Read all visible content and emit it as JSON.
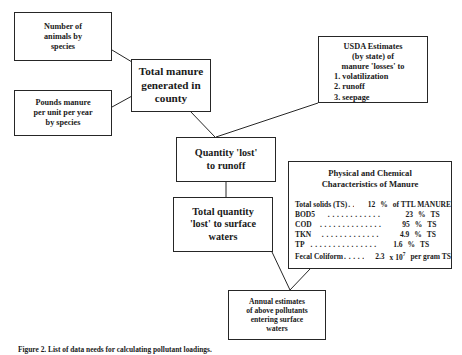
{
  "diagram": {
    "nodes": {
      "animals": {
        "name": "number-of-animals",
        "lines": [
          "Number of",
          "animals by",
          "species"
        ]
      },
      "pounds": {
        "name": "pounds-manure",
        "lines": [
          "Pounds manure",
          "per unit per year",
          "by species"
        ]
      },
      "total_manure": {
        "name": "total-manure-generated",
        "lines": [
          "Total manure",
          "generated in",
          "county"
        ]
      },
      "usda": {
        "name": "usda-estimates",
        "header": [
          "USDA Estimates",
          "(by state) of",
          "manure 'losses' to"
        ],
        "list": [
          "1.  volatilization",
          "2.  runoff",
          "3.  seepage"
        ]
      },
      "quantity_lost": {
        "name": "quantity-lost-runoff",
        "lines": [
          "Quantity 'lost'",
          "to runoff"
        ]
      },
      "total_quantity": {
        "name": "total-quantity-surface-waters",
        "lines": [
          "Total quantity",
          "'lost' to surface",
          "waters"
        ]
      },
      "chem": {
        "name": "manure-characteristics",
        "title": [
          "Physical and Chemical",
          "Characteristics of Manure"
        ],
        "rows": [
          {
            "label": "Total solids (TS)",
            "dots": ". . . .",
            "value": "12",
            "unit": "%",
            "rest": "of TTL MANURE",
            "exponent": ""
          },
          {
            "label": "BOD5",
            "dots": ". . . . . . . . . . . .",
            "value": "23",
            "unit": "%",
            "rest": "TS",
            "exponent": ""
          },
          {
            "label": "COD",
            "dots": ". . . . . . . . . . . . . .",
            "value": "95",
            "unit": "%",
            "rest": "TS",
            "exponent": ""
          },
          {
            "label": "TKN",
            "dots": ". . . . . . . . . . . . .",
            "value": "4.9",
            "unit": "%",
            "rest": "TS",
            "exponent": ""
          },
          {
            "label": "TP",
            "dots": ". . . . . . . . . . . . . . .",
            "value": "1.6",
            "unit": "%",
            "rest": "TS",
            "exponent": ""
          },
          {
            "label": "Fecal Coliform",
            "dots": ". . . . . .",
            "value": "2.3",
            "unit": "x 10",
            "rest": "per gram TS",
            "exponent": "7"
          }
        ]
      },
      "annual": {
        "name": "annual-estimates",
        "lines": [
          "Annual estimates",
          "of above pollutants",
          "entering surface",
          "waters"
        ]
      }
    },
    "caption": "Figure 2. List of data needs for calculating pollutant loadings.",
    "colors": {
      "line": "#262626",
      "text": "#1a1a1a",
      "background": "#ffffff"
    }
  }
}
